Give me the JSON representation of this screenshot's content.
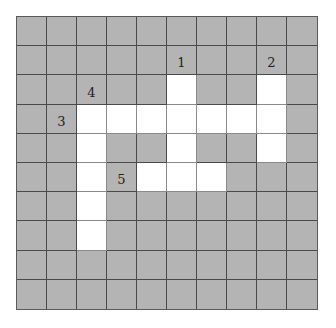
{
  "puzzle": {
    "rows": 10,
    "cols": 10,
    "colors": {
      "blocked": "#b4b4b4",
      "open": "#ffffff",
      "line": "#4a4a4a"
    },
    "open_cells": [
      [
        2,
        5
      ],
      [
        2,
        8
      ],
      [
        3,
        2
      ],
      [
        3,
        3
      ],
      [
        3,
        4
      ],
      [
        3,
        5
      ],
      [
        3,
        6
      ],
      [
        3,
        7
      ],
      [
        3,
        8
      ],
      [
        4,
        2
      ],
      [
        4,
        5
      ],
      [
        4,
        8
      ],
      [
        5,
        2
      ],
      [
        5,
        4
      ],
      [
        5,
        5
      ],
      [
        5,
        6
      ],
      [
        6,
        2
      ],
      [
        7,
        2
      ]
    ],
    "clue_numbers": [
      {
        "label": "1",
        "row": 1,
        "col": 5
      },
      {
        "label": "2",
        "row": 1,
        "col": 8
      },
      {
        "label": "4",
        "row": 2,
        "col": 2
      },
      {
        "label": "3",
        "row": 3,
        "col": 1
      },
      {
        "label": "5",
        "row": 5,
        "col": 3
      }
    ]
  }
}
